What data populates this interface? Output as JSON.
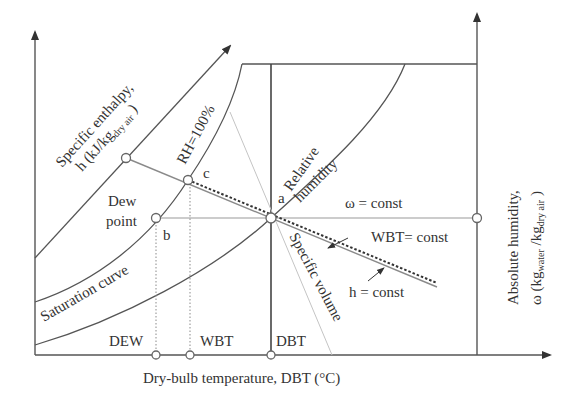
{
  "diagram": {
    "type": "psychrometric-chart-schematic",
    "x_axis_label": "Dry-bulb temperature, DBT (°C)",
    "y_axis_right_label_line1": "Absolute humidity,",
    "y_axis_right_label_line2_prefix": "ω (kg",
    "y_axis_right_label_line2_sub1": "water",
    "y_axis_right_label_line2_mid": " /kg",
    "y_axis_right_label_line2_sub2": "dry air",
    "y_axis_right_label_line2_suffix": " )",
    "enthalpy_label_line1": "Specific enthalpy,",
    "enthalpy_label_line2_prefix": "h (kJ/kg",
    "enthalpy_label_line2_sub": "dry air",
    "enthalpy_label_line2_suffix": " )",
    "rh100_label": "RH=100%",
    "relative_humidity_label_line1": "Relative",
    "relative_humidity_label_line2": "humidity",
    "saturation_curve_label": "Saturation curve",
    "dew_point_label_line1": "Dew",
    "dew_point_label_line2": "point",
    "omega_const_label": "ω = const",
    "wbt_const_label": "WBT= const",
    "h_const_label": "h = const",
    "specific_volume_label": "Specific volume",
    "points": {
      "a": "a",
      "b": "b",
      "c": "c"
    },
    "x_ticks": {
      "dew": "DEW",
      "wbt": "WBT",
      "dbt": "DBT"
    },
    "colors": {
      "line": "#555555",
      "text": "#333333",
      "guide": "#9a9a9a",
      "background": "#ffffff"
    }
  }
}
